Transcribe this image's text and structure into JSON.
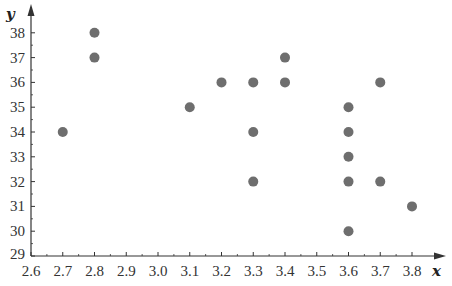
{
  "chart_data": {
    "type": "scatter",
    "title": "",
    "xlabel": "x",
    "ylabel": "y",
    "xlim": [
      2.6,
      3.85
    ],
    "ylim": [
      29,
      38.7
    ],
    "grid": false,
    "legend": null,
    "x_ticks": [
      "2.6",
      "2.7",
      "2.8",
      "2.9",
      "3.0",
      "3.1",
      "3.2",
      "3.3",
      "3.4",
      "3.5",
      "3.6",
      "3.7",
      "3.8"
    ],
    "y_ticks": [
      "29",
      "30",
      "31",
      "32",
      "33",
      "34",
      "35",
      "36",
      "37",
      "38"
    ],
    "points": [
      {
        "x": 2.7,
        "y": 34
      },
      {
        "x": 2.8,
        "y": 38
      },
      {
        "x": 2.8,
        "y": 37
      },
      {
        "x": 3.1,
        "y": 35
      },
      {
        "x": 3.2,
        "y": 36
      },
      {
        "x": 3.3,
        "y": 36
      },
      {
        "x": 3.3,
        "y": 34
      },
      {
        "x": 3.3,
        "y": 32
      },
      {
        "x": 3.4,
        "y": 37
      },
      {
        "x": 3.4,
        "y": 36
      },
      {
        "x": 3.6,
        "y": 35
      },
      {
        "x": 3.6,
        "y": 34
      },
      {
        "x": 3.6,
        "y": 33
      },
      {
        "x": 3.6,
        "y": 32
      },
      {
        "x": 3.6,
        "y": 30
      },
      {
        "x": 3.7,
        "y": 36
      },
      {
        "x": 3.7,
        "y": 32
      },
      {
        "x": 3.8,
        "y": 31
      }
    ],
    "colors": {
      "point": "#6e6e6e",
      "axis": "#333333"
    }
  }
}
